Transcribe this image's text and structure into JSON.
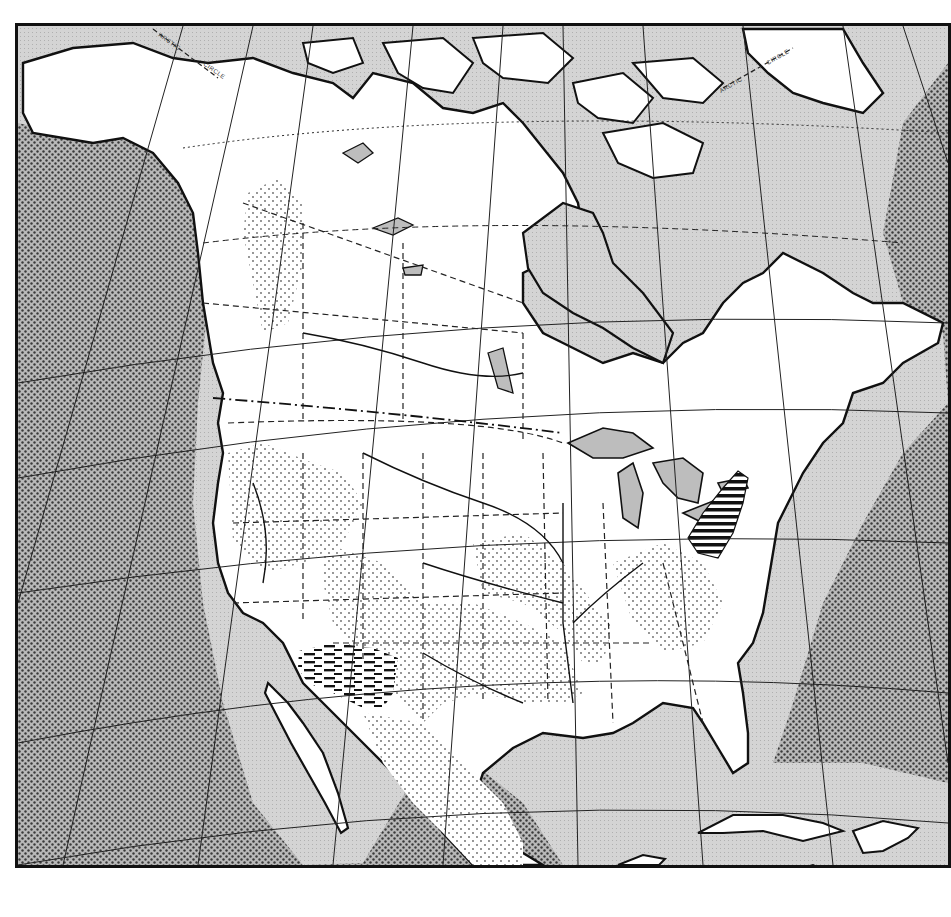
{
  "map": {
    "title": "North America",
    "type": "physiographic outline map, scanned black-and-white print",
    "labels": {
      "arctic_circle_west_1": "ARCTIC",
      "arctic_circle_west_2": "CIRCLE",
      "arctic_circle_east_1": "ARCTIC",
      "arctic_circle_east_2": "CIRCLE"
    },
    "colors": {
      "ocean_deep": "#9a9a9a",
      "ocean_shelf": "#cfcfcf",
      "land": "#ffffff",
      "lakes": "#bdbdbd",
      "coastline": "#111111",
      "border": "#111111",
      "stipple": "#555555"
    },
    "patterns": [
      {
        "name": "dense-dots",
        "meaning": "deep ocean"
      },
      {
        "name": "light-grain",
        "meaning": "continental shelf / lakes"
      },
      {
        "name": "sparse-dots",
        "meaning": "interior land regions"
      },
      {
        "name": "horizontal-dashes",
        "meaning": "southwest region (Arizona/New Mexico)"
      },
      {
        "name": "horizontal-bars",
        "meaning": "Appalachian region (Pennsylvania/West Virginia)"
      }
    ],
    "features": [
      "Alaska",
      "Canadian Arctic Archipelago",
      "Greenland",
      "Hudson Bay",
      "Great Lakes",
      "Gulf of Mexico",
      "Florida",
      "Baja California",
      "Mexico",
      "Cuba",
      "Hispaniola",
      "Jamaica",
      "Yucatan"
    ]
  }
}
